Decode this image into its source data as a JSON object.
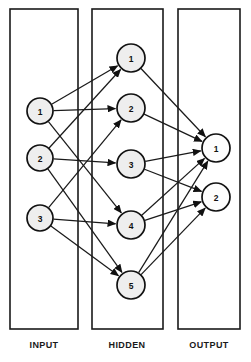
{
  "diagram": {
    "type": "neural-network",
    "title": "",
    "background_color": "#ffffff",
    "stroke_color": "#1a1a1a",
    "node_fill_color": "#eeeeee",
    "output_node_fill_color": "#fdfdfd",
    "layers": [
      {
        "id": "input",
        "caption": "INPUT",
        "box": {
          "x": 10,
          "y": 9,
          "width": 68,
          "height": 320
        },
        "caption_pos": {
          "x": 44,
          "y": 348
        },
        "nodes": [
          {
            "id": "i1",
            "label": "1",
            "cx": 40,
            "cy": 111,
            "r": 13
          },
          {
            "id": "i2",
            "label": "2",
            "cx": 40,
            "cy": 158,
            "r": 13
          },
          {
            "id": "i3",
            "label": "3",
            "cx": 40,
            "cy": 218,
            "r": 13
          }
        ]
      },
      {
        "id": "hidden",
        "caption": "HIDDEN",
        "box": {
          "x": 92,
          "y": 9,
          "width": 71,
          "height": 320
        },
        "caption_pos": {
          "x": 127,
          "y": 348
        },
        "nodes": [
          {
            "id": "h1",
            "label": "1",
            "cx": 131,
            "cy": 58,
            "r": 14
          },
          {
            "id": "h2",
            "label": "2",
            "cx": 131,
            "cy": 108,
            "r": 14
          },
          {
            "id": "h3",
            "label": "3",
            "cx": 131,
            "cy": 164,
            "r": 14
          },
          {
            "id": "h4",
            "label": "4",
            "cx": 131,
            "cy": 225,
            "r": 14
          },
          {
            "id": "h5",
            "label": "5",
            "cx": 131,
            "cy": 285,
            "r": 14
          }
        ]
      },
      {
        "id": "output",
        "caption": "OUTPUT",
        "box": {
          "x": 178,
          "y": 9,
          "width": 62,
          "height": 320
        },
        "caption_pos": {
          "x": 209,
          "y": 348
        },
        "nodes": [
          {
            "id": "o1",
            "label": "1",
            "cx": 216,
            "cy": 148,
            "r": 14
          },
          {
            "id": "o2",
            "label": "2",
            "cx": 216,
            "cy": 197,
            "r": 14
          }
        ]
      }
    ],
    "edges": [
      {
        "from": "i1",
        "to": "h1"
      },
      {
        "from": "i1",
        "to": "h2"
      },
      {
        "from": "i1",
        "to": "h4"
      },
      {
        "from": "i2",
        "to": "h1"
      },
      {
        "from": "i2",
        "to": "h3"
      },
      {
        "from": "i2",
        "to": "h5"
      },
      {
        "from": "i3",
        "to": "h2"
      },
      {
        "from": "i3",
        "to": "h4"
      },
      {
        "from": "i3",
        "to": "h5"
      },
      {
        "from": "h1",
        "to": "o1"
      },
      {
        "from": "h2",
        "to": "o1"
      },
      {
        "from": "h3",
        "to": "o1"
      },
      {
        "from": "h3",
        "to": "o2"
      },
      {
        "from": "h4",
        "to": "o1"
      },
      {
        "from": "h4",
        "to": "o2"
      },
      {
        "from": "h5",
        "to": "o1"
      },
      {
        "from": "h5",
        "to": "o2"
      }
    ]
  }
}
